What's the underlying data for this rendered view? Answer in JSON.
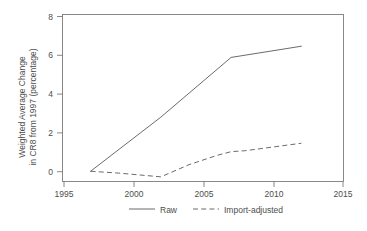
{
  "chart_data": {
    "type": "line",
    "title": "",
    "xlabel": "",
    "ylabel": "Weighted Average Change in CR8 from 1997 (percentage)",
    "ylabel_line1": "Weighted Average Change",
    "ylabel_line2": "in CR8 from 1997 (percentage)",
    "xlim": [
      1995,
      2015
    ],
    "ylim": [
      -0.55,
      8.4
    ],
    "xticks": [
      1995,
      2000,
      2005,
      2010,
      2015
    ],
    "xtick_labels": [
      "1995",
      "2000",
      "2005",
      "2010",
      "2015"
    ],
    "yticks": [
      0,
      2,
      4,
      6,
      8
    ],
    "ytick_labels": [
      "0",
      "2",
      "4",
      "6",
      "8"
    ],
    "grid": false,
    "legend_position": "below-axes",
    "series": [
      {
        "name": "Raw",
        "style": "solid",
        "color": "#5a5a5a",
        "x": [
          1997,
          2002,
          2007,
          2012
        ],
        "values": [
          0.0,
          2.9,
          6.1,
          6.7
        ]
      },
      {
        "name": "Import-adjusted",
        "style": "dashed",
        "color": "#5a5a5a",
        "x": [
          1997,
          1999,
          2002,
          2004,
          2006,
          2007,
          2008,
          2010,
          2012
        ],
        "values": [
          0.0,
          -0.1,
          -0.3,
          0.35,
          0.85,
          1.05,
          1.1,
          1.3,
          1.5
        ]
      }
    ]
  },
  "legend": {
    "entries": [
      {
        "label": "Raw",
        "style": "solid"
      },
      {
        "label": "Import-adjusted",
        "style": "dashed"
      }
    ]
  }
}
